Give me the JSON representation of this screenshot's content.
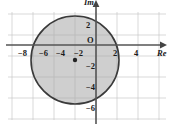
{
  "figure": {
    "kind": "argand-diagram",
    "background": "#ffffff",
    "plot_area": {
      "x0": 8,
      "y0": 12,
      "x1": 166,
      "y1": 120
    }
  },
  "axes": {
    "real_axis_label": "Re",
    "imag_axis_label": "Im",
    "origin_label": "O",
    "x_ticks": [
      {
        "value": -8,
        "text": "−8",
        "px": 22
      },
      {
        "value": -6,
        "text": "−6",
        "px": 43
      },
      {
        "value": -4,
        "text": "−4",
        "px": 60
      },
      {
        "value": -2,
        "text": "−2",
        "px": 78
      },
      {
        "value": 2,
        "text": "2",
        "px": 117
      },
      {
        "value": 4,
        "text": "4",
        "px": 138
      }
    ],
    "y_ticks": [
      {
        "value": 2,
        "text": "2",
        "px": 25
      },
      {
        "value": -2,
        "text": "−2",
        "px": 66
      },
      {
        "value": -4,
        "text": "−4",
        "px": 87
      },
      {
        "value": -6,
        "text": "−6",
        "px": 108
      }
    ],
    "origin_px": {
      "x": 96,
      "y": 45
    },
    "units_per_px": 10.5,
    "axis_color": "#555555",
    "arrow_color": "#444444"
  },
  "grid": {
    "visible": true,
    "color": "#c9c9c9",
    "spacing_px": 21,
    "x_lines": [
      12,
      33,
      54,
      75,
      96,
      117,
      138,
      159
    ],
    "y_lines": [
      14,
      35,
      56,
      77,
      98,
      119
    ]
  },
  "shape": {
    "type": "disk",
    "center": {
      "re": -2,
      "im": -2
    },
    "radius": 4,
    "center_px": {
      "x": 75,
      "y": 60
    },
    "radius_px": 44,
    "fill": "#a8a8a8",
    "fill_opacity": 0.55,
    "stroke": "#3a3a3a",
    "stroke_width": 1.6,
    "center_dot_color": "#222222",
    "center_dot_radius_px": 2.2
  },
  "chart_data": {
    "type": "scatter",
    "title": "",
    "xlabel": "Re",
    "ylabel": "Im",
    "xlim": [
      -10,
      7.5
    ],
    "ylim": [
      -7.5,
      3.5
    ],
    "grid": true,
    "legend": "none",
    "annotations": [
      {
        "kind": "filled-circle",
        "center": [
          -2,
          -2
        ],
        "radius": 4,
        "description": "Shaded disk of radius 4 centred at -2-2i"
      },
      {
        "kind": "point",
        "at": [
          -2,
          -2
        ],
        "label": ""
      }
    ]
  }
}
